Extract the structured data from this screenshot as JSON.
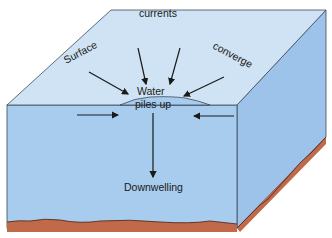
{
  "diagram": {
    "labels": {
      "surface": "Surface",
      "currents": "currents",
      "converge": "converge",
      "water": "Water",
      "piles_up": "piles up",
      "downwelling": "Downwelling"
    },
    "colors": {
      "top_face": "#cfe3f5",
      "front_face": "#a8ccee",
      "right_face": "#9ec3ea",
      "edge": "#3b4a5a",
      "seafloor": "#c06a4a",
      "seafloor_line": "#5a2a1a",
      "arrow": "#1a1a1a"
    }
  }
}
